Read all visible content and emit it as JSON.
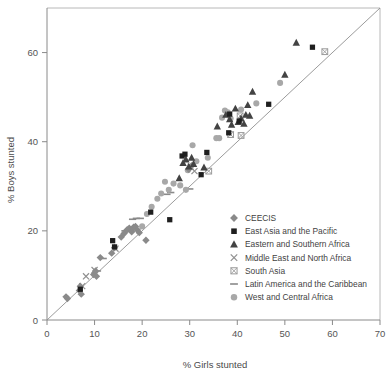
{
  "chart_data": {
    "type": "scatter",
    "title": "",
    "xlabel": "% Girls stunted",
    "ylabel": "% Boys stunted",
    "xlim": [
      0,
      70
    ],
    "ylim": [
      0,
      70
    ],
    "xticks": [
      0,
      10,
      20,
      30,
      40,
      50,
      60,
      70
    ],
    "yticks": [
      0,
      20,
      40,
      60
    ],
    "grid": false,
    "legend_position": "inside-lower-right",
    "annotations": [
      {
        "type": "line",
        "name": "identity-line",
        "from": [
          0,
          0
        ],
        "to": [
          70,
          70
        ]
      }
    ],
    "series": [
      {
        "name": "CEECIS",
        "marker": "diamond",
        "color": "#8a8a8a",
        "points": [
          [
            4.0,
            5.2
          ],
          [
            4.3,
            4.8
          ],
          [
            6.8,
            6.6
          ],
          [
            7.0,
            7.6
          ],
          [
            7.2,
            5.8
          ],
          [
            9.8,
            10.2
          ],
          [
            10.2,
            11.0
          ],
          [
            10.4,
            9.8
          ],
          [
            11.2,
            14.0
          ],
          [
            13.6,
            15.0
          ],
          [
            14.2,
            16.2
          ],
          [
            15.6,
            18.6
          ],
          [
            16.2,
            19.4
          ],
          [
            16.8,
            20.2
          ],
          [
            17.3,
            20.6
          ],
          [
            17.8,
            19.8
          ],
          [
            18.2,
            20.8
          ],
          [
            18.6,
            21.0
          ],
          [
            19.0,
            20.2
          ],
          [
            19.4,
            19.6
          ],
          [
            20.8,
            17.9
          ],
          [
            29.8,
            33.8
          ],
          [
            30.4,
            34.6
          ]
        ]
      },
      {
        "name": "East Asia and the Pacific",
        "marker": "square",
        "color": "#1f1f1f",
        "points": [
          [
            7.0,
            6.9
          ],
          [
            13.8,
            17.8
          ],
          [
            14.2,
            16.4
          ],
          [
            21.8,
            24.2
          ],
          [
            25.8,
            22.5
          ],
          [
            28.4,
            36.8
          ],
          [
            29.0,
            37.2
          ],
          [
            32.4,
            32.6
          ],
          [
            33.6,
            37.6
          ],
          [
            38.2,
            42.0
          ],
          [
            38.4,
            46.2
          ],
          [
            40.4,
            44.6
          ],
          [
            46.6,
            48.4
          ],
          [
            55.8,
            61.2
          ]
        ]
      },
      {
        "name": "Eastern and Southern Africa",
        "marker": "triangle",
        "color": "#434343",
        "points": [
          [
            27.8,
            31.8
          ],
          [
            28.6,
            35.2
          ],
          [
            29.2,
            36.0
          ],
          [
            29.8,
            34.4
          ],
          [
            30.4,
            36.4
          ],
          [
            30.8,
            35.0
          ],
          [
            33.0,
            34.2
          ],
          [
            35.8,
            43.4
          ],
          [
            37.6,
            46.0
          ],
          [
            38.4,
            45.0
          ],
          [
            38.8,
            43.8
          ],
          [
            39.6,
            47.4
          ],
          [
            40.2,
            44.4
          ],
          [
            40.8,
            45.2
          ],
          [
            41.4,
            44.0
          ],
          [
            41.8,
            46.0
          ],
          [
            42.2,
            48.2
          ],
          [
            42.6,
            45.8
          ],
          [
            43.2,
            51.2
          ],
          [
            50.0,
            55.0
          ],
          [
            52.4,
            62.2
          ]
        ]
      },
      {
        "name": "Middle East and North Africa",
        "marker": "x",
        "color": "#8f8f8f",
        "points": [
          [
            7.4,
            7.6
          ],
          [
            8.2,
            9.8
          ],
          [
            10.0,
            11.2
          ],
          [
            14.4,
            16.0
          ],
          [
            17.6,
            20.4
          ],
          [
            30.2,
            34.4
          ],
          [
            31.0,
            33.4
          ]
        ]
      },
      {
        "name": "South Asia",
        "marker": "boxed-x",
        "color": "#9a9a9a",
        "points": [
          [
            34.0,
            33.4
          ],
          [
            38.6,
            41.6
          ],
          [
            40.8,
            41.4
          ],
          [
            40.6,
            45.8
          ],
          [
            58.4,
            60.2
          ]
        ]
      },
      {
        "name": "Latin America and the Caribbean",
        "marker": "dash",
        "color": "#8a8a8a",
        "points": [
          [
            10.6,
            11.0
          ],
          [
            11.8,
            13.8
          ],
          [
            16.4,
            20.0
          ],
          [
            17.0,
            20.0
          ],
          [
            18.0,
            22.6
          ],
          [
            18.8,
            22.8
          ],
          [
            19.6,
            22.8
          ],
          [
            25.2,
            28.2
          ],
          [
            26.0,
            28.6
          ],
          [
            30.0,
            29.4
          ]
        ]
      },
      {
        "name": "West and Central Africa",
        "marker": "circle",
        "color": "#a8a8a8",
        "points": [
          [
            17.8,
            20.0
          ],
          [
            20.0,
            21.0
          ],
          [
            21.0,
            23.8
          ],
          [
            22.0,
            25.4
          ],
          [
            23.2,
            27.2
          ],
          [
            24.0,
            28.4
          ],
          [
            24.8,
            31.0
          ],
          [
            25.6,
            29.2
          ],
          [
            26.6,
            30.6
          ],
          [
            28.0,
            30.2
          ],
          [
            29.2,
            29.2
          ],
          [
            29.6,
            33.6
          ],
          [
            30.6,
            39.2
          ],
          [
            31.4,
            35.6
          ],
          [
            33.8,
            36.4
          ],
          [
            35.6,
            40.8
          ],
          [
            36.2,
            40.8
          ],
          [
            36.8,
            45.4
          ],
          [
            37.4,
            47.0
          ],
          [
            38.0,
            46.6
          ],
          [
            38.6,
            45.2
          ],
          [
            40.8,
            47.2
          ],
          [
            44.0,
            48.6
          ],
          [
            49.0,
            53.2
          ]
        ]
      }
    ]
  },
  "axes": {
    "x_title": "% Girls stunted",
    "y_title": "% Boys stunted",
    "x_tick_labels": [
      "0",
      "10",
      "20",
      "30",
      "40",
      "50",
      "60",
      "70"
    ],
    "y_tick_labels": [
      "0",
      "20",
      "40",
      "60"
    ]
  },
  "legend": {
    "items": [
      {
        "label": "CEECIS",
        "marker": "diamond",
        "color": "#8a8a8a"
      },
      {
        "label": "East Asia and the Pacific",
        "marker": "square",
        "color": "#1f1f1f"
      },
      {
        "label": "Eastern and Southern Africa",
        "marker": "triangle",
        "color": "#434343"
      },
      {
        "label": "Middle East and North Africa",
        "marker": "x",
        "color": "#8f8f8f"
      },
      {
        "label": "South Asia",
        "marker": "boxed-x",
        "color": "#9a9a9a"
      },
      {
        "label": "Latin America and the Caribbean",
        "marker": "dash",
        "color": "#8a8a8a"
      },
      {
        "label": "West and Central Africa",
        "marker": "circle",
        "color": "#a8a8a8"
      }
    ]
  },
  "colors": {
    "background": "#ffffff",
    "axis": "#8a8a8a",
    "frame": "#b8b8b8",
    "identity_line": "#909090",
    "text": "#4a4a4a"
  }
}
